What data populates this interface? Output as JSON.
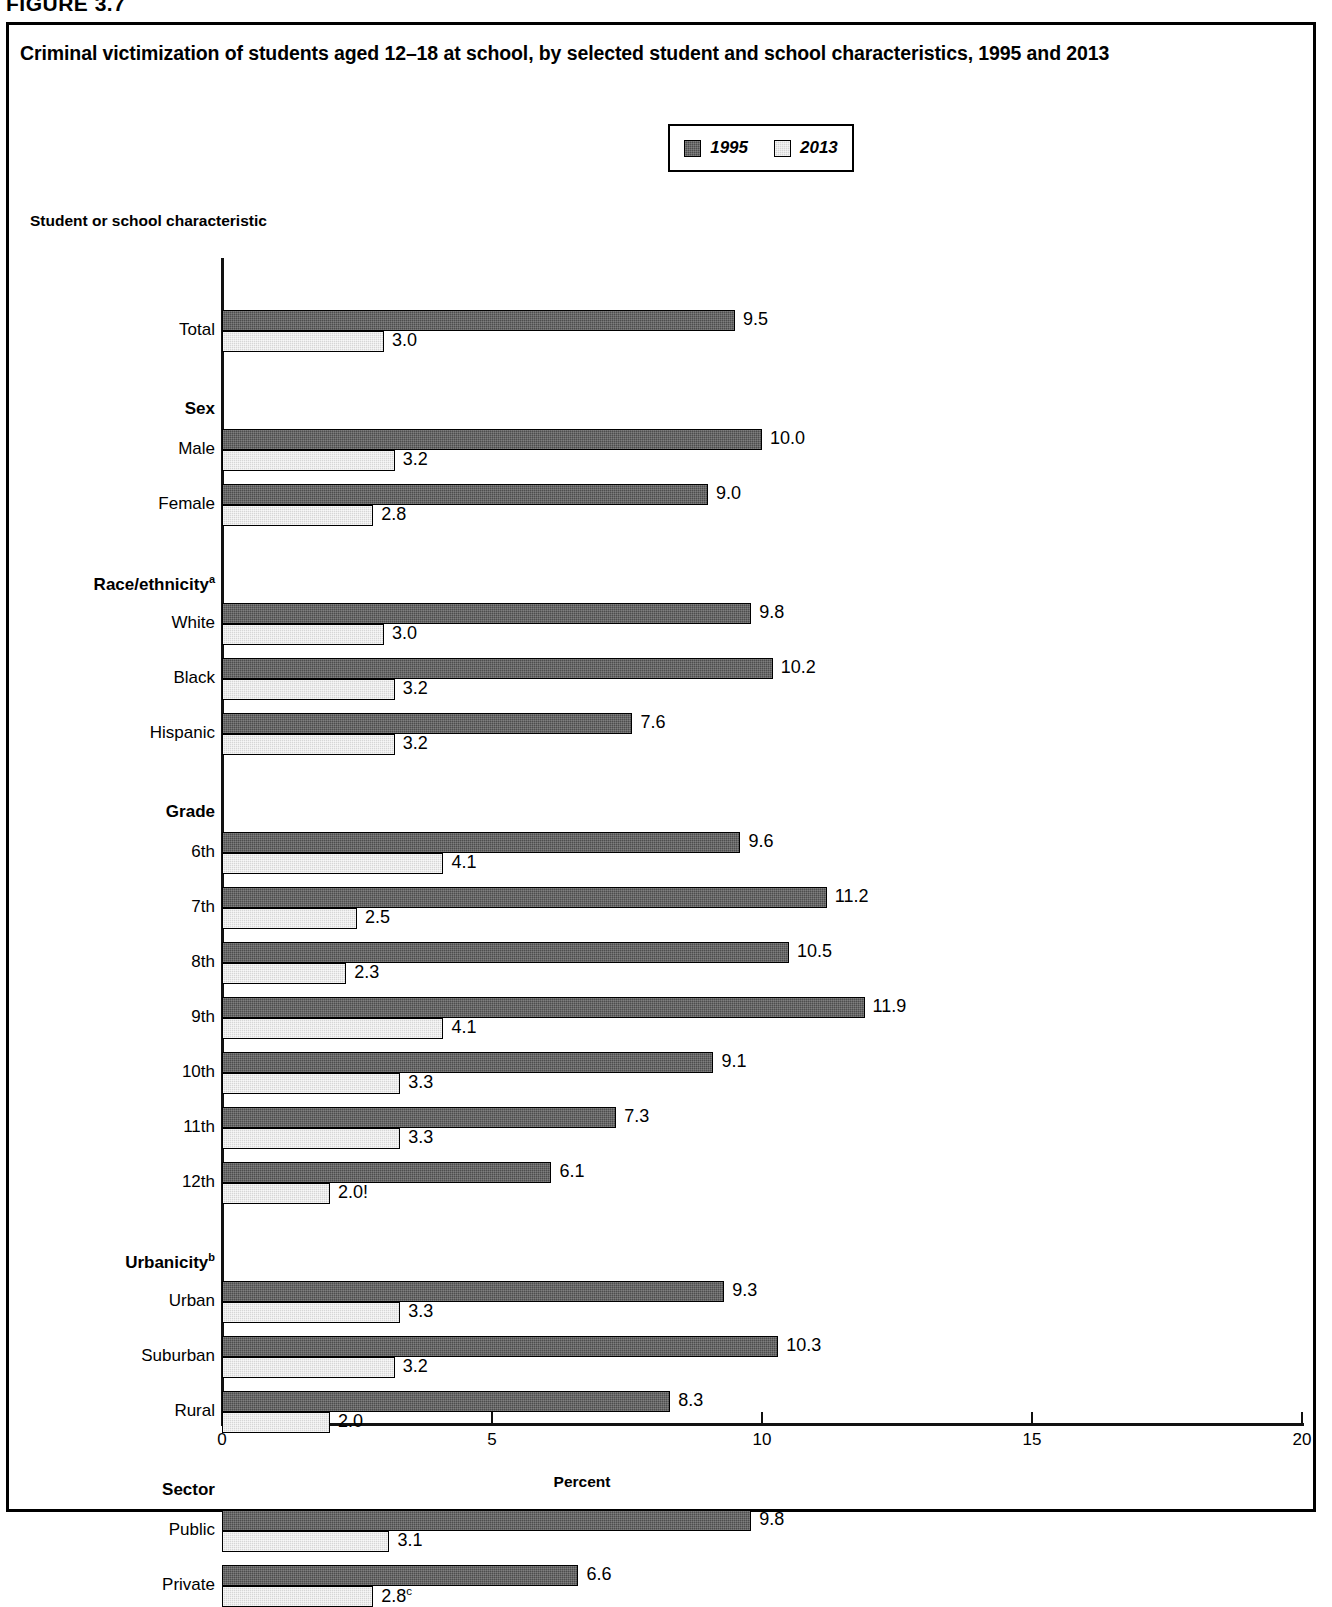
{
  "figure_label": "FIGURE 3.7",
  "title": "Criminal victimization of students aged 12–18 at school, by selected student and school characteristics, 1995 and 2013",
  "axis_caption": "Student or school characteristic",
  "legend": {
    "items": [
      {
        "label": "1995",
        "swatch": "dark-gray-swatch",
        "color": "#4d4d4d"
      },
      {
        "label": "2013",
        "swatch": "light-gray-swatch",
        "color": "#d6d6d6"
      }
    ]
  },
  "chart_data": {
    "type": "bar",
    "orientation": "horizontal",
    "title": "Criminal victimization of students aged 12–18 at school, by selected student and school characteristics, 1995 and 2013",
    "xlabel": "Percent",
    "ylabel": "Student or school characteristic",
    "xlim": [
      0,
      20
    ],
    "xticks": [
      0,
      5,
      10,
      15,
      20
    ],
    "xticklabels": [
      "0",
      "5",
      "10",
      "15",
      "20"
    ],
    "grid": false,
    "legend_position": "top-center",
    "series": [
      {
        "name": "1995",
        "color": "#4d4d4d"
      },
      {
        "name": "2013",
        "color": "#d6d6d6"
      }
    ],
    "groups": [
      {
        "heading": "",
        "categories": [
          {
            "label": "Total",
            "values": [
              9.5,
              3.0
            ],
            "labels": [
              "9.5",
              "3.0"
            ]
          }
        ]
      },
      {
        "heading": "Sex",
        "categories": [
          {
            "label": "Male",
            "values": [
              10.0,
              3.2
            ],
            "labels": [
              "10.0",
              "3.2"
            ]
          },
          {
            "label": "Female",
            "values": [
              9.0,
              2.8
            ],
            "labels": [
              "9.0",
              "2.8"
            ]
          }
        ]
      },
      {
        "heading": "Race/ethnicity",
        "heading_sup": "a",
        "categories": [
          {
            "label": "White",
            "values": [
              9.8,
              3.0
            ],
            "labels": [
              "9.8",
              "3.0"
            ]
          },
          {
            "label": "Black",
            "values": [
              10.2,
              3.2
            ],
            "labels": [
              "10.2",
              "3.2"
            ]
          },
          {
            "label": "Hispanic",
            "values": [
              7.6,
              3.2
            ],
            "labels": [
              "7.6",
              "3.2"
            ]
          }
        ]
      },
      {
        "heading": "Grade",
        "categories": [
          {
            "label": "6th",
            "values": [
              9.6,
              4.1
            ],
            "labels": [
              "9.6",
              "4.1"
            ]
          },
          {
            "label": "7th",
            "values": [
              11.2,
              2.5
            ],
            "labels": [
              "11.2",
              "2.5"
            ]
          },
          {
            "label": "8th",
            "values": [
              10.5,
              2.3
            ],
            "labels": [
              "10.5",
              "2.3"
            ]
          },
          {
            "label": "9th",
            "values": [
              11.9,
              4.1
            ],
            "labels": [
              "11.9",
              "4.1"
            ]
          },
          {
            "label": "10th",
            "values": [
              9.1,
              3.3
            ],
            "labels": [
              "9.1",
              "3.3"
            ]
          },
          {
            "label": "11th",
            "values": [
              7.3,
              3.3
            ],
            "labels": [
              "7.3",
              "3.3"
            ]
          },
          {
            "label": "12th",
            "values": [
              6.1,
              2.0
            ],
            "labels": [
              "6.1",
              "2.0!"
            ]
          }
        ]
      },
      {
        "heading": "Urbanicity",
        "heading_sup": "b",
        "categories": [
          {
            "label": "Urban",
            "values": [
              9.3,
              3.3
            ],
            "labels": [
              "9.3",
              "3.3"
            ]
          },
          {
            "label": "Suburban",
            "values": [
              10.3,
              3.2
            ],
            "labels": [
              "10.3",
              "3.2"
            ]
          },
          {
            "label": "Rural",
            "values": [
              8.3,
              2.0
            ],
            "labels": [
              "8.3",
              "2.0"
            ]
          }
        ]
      },
      {
        "heading": "Sector",
        "categories": [
          {
            "label": "Public",
            "values": [
              9.8,
              3.1
            ],
            "labels": [
              "9.8",
              "3.1"
            ]
          },
          {
            "label": "Private",
            "values": [
              6.6,
              2.8
            ],
            "labels": [
              "6.6",
              "2.8"
            ],
            "value_sup": [
              null,
              "c"
            ]
          }
        ]
      }
    ]
  }
}
